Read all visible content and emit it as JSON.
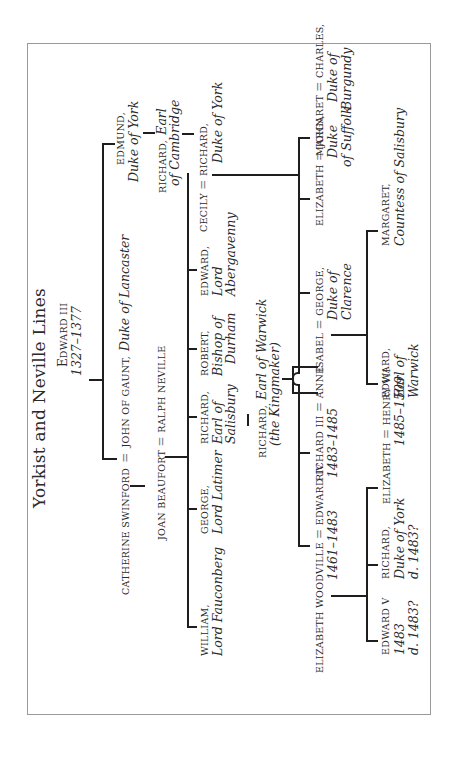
{
  "title": "Yorkist and Neville Lines",
  "root": {
    "name": "EDWARD III",
    "name_first": "E",
    "name_rest": "DWARD III",
    "dates": "1327–1377"
  },
  "edmund": {
    "name": "EDMUND,",
    "title": "Duke of York"
  },
  "richard_cambridge": {
    "name": "RICHARD,",
    "title_1": "Earl",
    "title_2": "of Cambridge"
  },
  "cecily_richard": {
    "wife": "CECILY",
    "eq": "=",
    "husband": "RICHARD,",
    "title": "Duke of York"
  },
  "gaunt": {
    "wife": "CATHERINE SWINFORD",
    "eq": "=",
    "husband": "JOHN OF GAUNT,",
    "title": "Duke of Lancaster"
  },
  "beaufort_neville": {
    "wife": "JOAN BEAUFORT",
    "eq": "=",
    "husband": "RALPH NEVILLE"
  },
  "neville_children": [
    {
      "name": "WILLIAM,",
      "title_1": "Lord Fauconberg"
    },
    {
      "name": "GEORGE,",
      "title_1": "Lord Latimer"
    },
    {
      "name": "RICHARD,",
      "title_1": "Earl of",
      "title_2": "Salisbury"
    },
    {
      "name": "ROBERT,",
      "title_1": "Bishop of",
      "title_2": "Durham"
    },
    {
      "name": "EDWARD,",
      "title_1": "Lord",
      "title_2": "Abergavenny"
    }
  ],
  "warwick": {
    "name": "RICHARD,",
    "title": "Earl of Warwick",
    "epithet": "(the Kingmaker)"
  },
  "york_children": {
    "edward_iv": {
      "wife": "ELIZABETH WOODVILLE",
      "eq": "=",
      "name": "EDWARD IV",
      "dates": "1461–1483"
    },
    "richard_iii": {
      "name": "RICHARD III",
      "eq": "=",
      "wife": "ANNE",
      "dates": "1483–1485"
    },
    "george": {
      "wife": "ISABEL",
      "eq": "=",
      "name": "GEORGE,",
      "title_1": "Duke of",
      "title_2": "Clarence"
    },
    "elizabeth": {
      "name": "ELIZABETH",
      "eq": "=",
      "husband": "JOHN,",
      "title_1": "Duke",
      "title_2": "of Suffolk"
    },
    "margaret": {
      "name": "MARGARET",
      "eq": "=",
      "husband": "CHARLES,",
      "title_1": "Duke of",
      "title_2": "Burgundy"
    }
  },
  "edward_iv_children": [
    {
      "name": "EDWARD V",
      "line_1": "1483",
      "line_2": "d. 1483?"
    },
    {
      "name": "RICHARD,",
      "line_1": "Duke of York",
      "line_2": "d. 1483?"
    },
    {
      "name": "ELIZABETH",
      "eq": "=",
      "husband": "HENRY VII",
      "dates": "1485–1509"
    }
  ],
  "clarence_children": [
    {
      "name": "EDWARD,",
      "title_1": "Earl of",
      "title_2": "Warwick"
    },
    {
      "name": "MARGARET,",
      "title_1": "Countess of Salisbury"
    }
  ]
}
